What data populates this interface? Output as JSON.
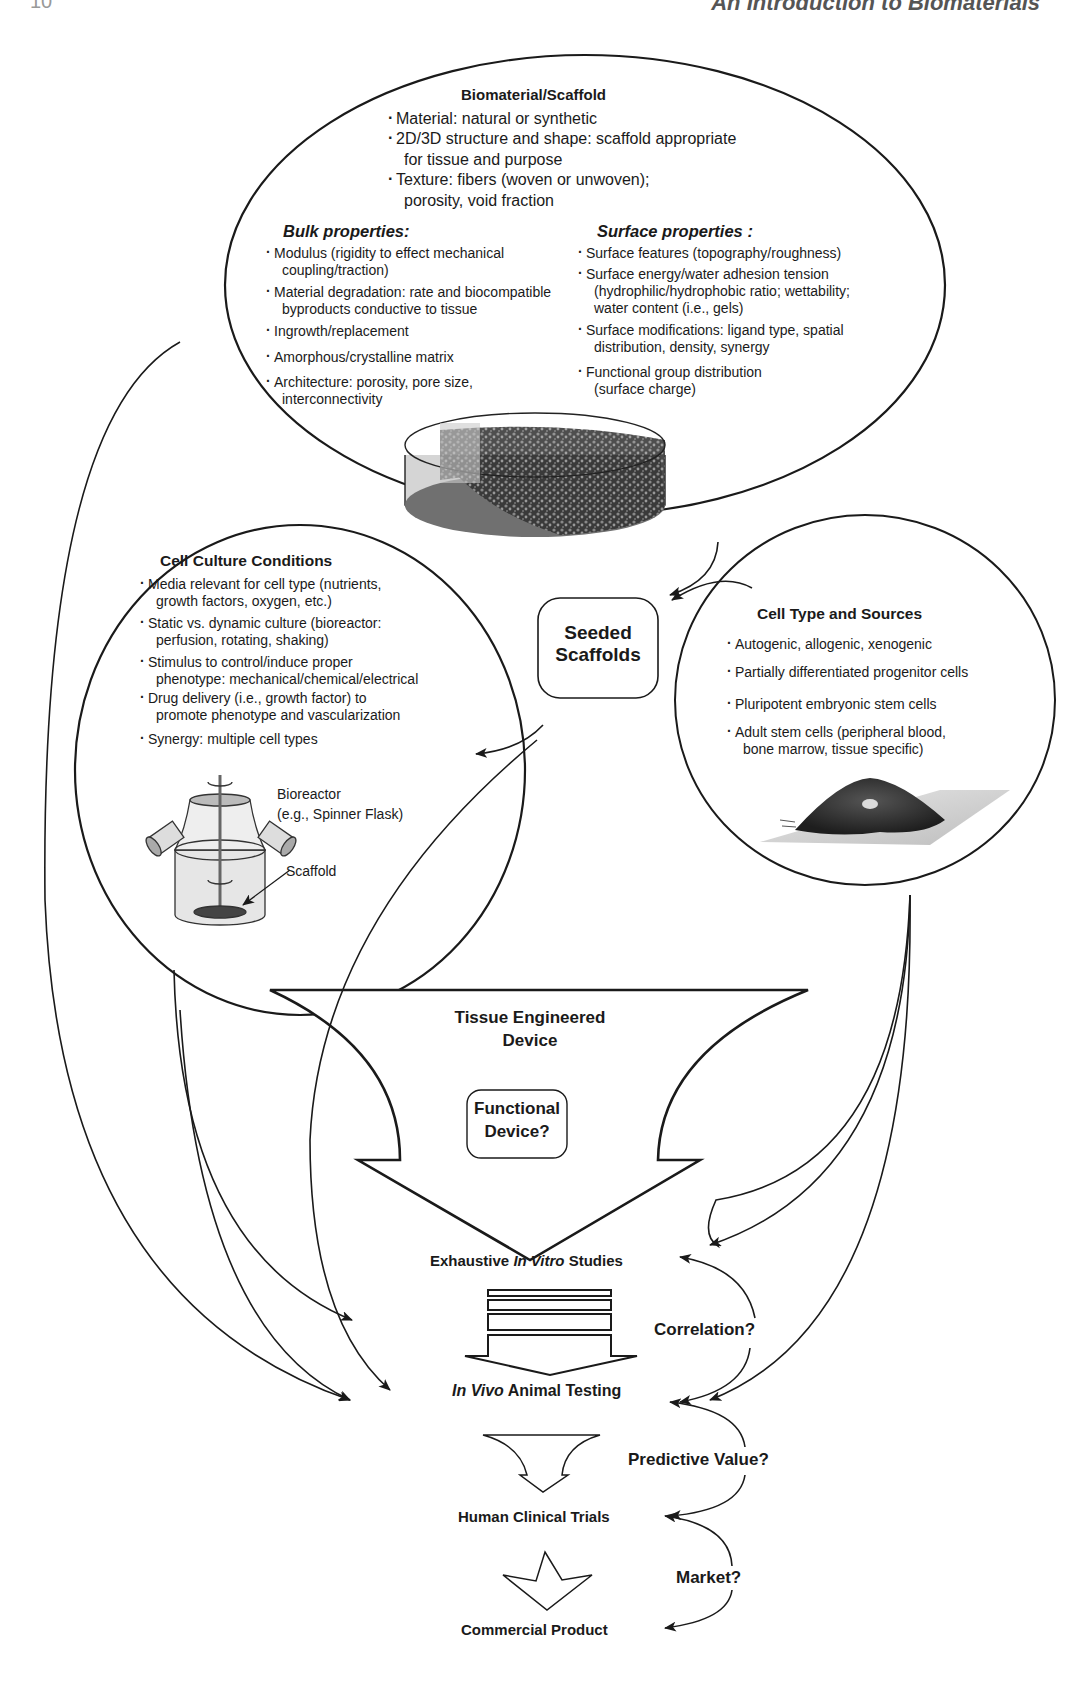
{
  "page": {
    "running_head": "An Introduction to Biomaterials",
    "page_number": "10"
  },
  "biomaterial": {
    "title": "Biomaterial/Scaffold",
    "general": [
      "Material: natural or synthetic",
      "2D/3D structure and shape: scaffold appropriate",
      "for tissue and purpose",
      "Texture: fibers (woven or unwoven);",
      "porosity, void fraction"
    ],
    "bulk": {
      "title": "Bulk properties:",
      "items": [
        "Modulus (rigidity to effect mechanical",
        "coupling/traction)",
        "Material degradation: rate and biocompatible",
        "byproducts conductive to tissue",
        "Ingrowth/replacement",
        "Amorphous/crystalline matrix",
        "Architecture: porosity, pore size,",
        "interconnectivity"
      ]
    },
    "surface": {
      "title": "Surface properties :",
      "items": [
        "Surface features (topography/roughness)",
        "Surface energy/water adhesion tension",
        "(hydrophilic/hydrophobic ratio; wettability;",
        "water content (i.e., gels)",
        "Surface modifications: ligand type, spatial",
        "distribution, density, synergy",
        "Functional group distribution",
        "(surface charge)"
      ]
    }
  },
  "cell_culture": {
    "title": "Cell Culture Conditions",
    "items": [
      "Media relevant for cell type (nutrients,",
      "growth factors, oxygen, etc.)",
      "Static vs. dynamic culture (bioreactor:",
      "perfusion, rotating, shaking)",
      "Stimulus to control/induce proper",
      "phenotype: mechanical/chemical/electrical",
      "Drug delivery (i.e., growth factor) to",
      "promote phenotype and vascularization",
      "Synergy: multiple cell types"
    ],
    "bioreactor_label_1": "Bioreactor",
    "bioreactor_label_2": "(e.g., Spinner Flask)",
    "scaffold_label": "Scaffold"
  },
  "seeded": {
    "line1": "Seeded",
    "line2": "Scaffolds"
  },
  "cell_type": {
    "title": "Cell Type and Sources",
    "items": [
      "Autogenic, allogenic, xenogenic",
      "Partially differentiated progenitor cells",
      "Pluripotent embryonic stem cells",
      "Adult stem cells (peripheral blood,",
      "bone marrow, tissue specific)"
    ]
  },
  "device": {
    "line1": "Tissue Engineered",
    "line2": "Device",
    "functional_1": "Functional",
    "functional_2": "Device?"
  },
  "pipeline": {
    "in_vitro_a": "Exhaustive ",
    "in_vitro_b": "In Vitro",
    "in_vitro_c": " Studies",
    "in_vivo_a": "In Vivo",
    "in_vivo_b": " Animal Testing",
    "clinical": "Human Clinical Trials",
    "commercial": "Commercial Product",
    "correlation": "Correlation?",
    "predictive": "Predictive Value?",
    "market": "Market?"
  }
}
